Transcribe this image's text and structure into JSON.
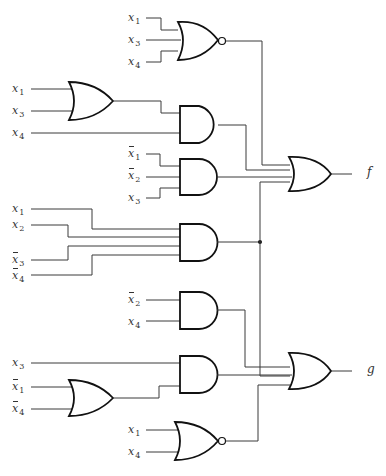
{
  "diagram": {
    "title": "",
    "outputs": {
      "f": "f",
      "g": "g"
    },
    "labels": [
      {
        "id": "g1_in1",
        "var": "x",
        "sub": "1",
        "complement": false,
        "x": 128,
        "y": 12
      },
      {
        "id": "g1_in2",
        "var": "x",
        "sub": "3",
        "complement": false,
        "x": 128,
        "y": 34
      },
      {
        "id": "g1_in3",
        "var": "x",
        "sub": "4",
        "complement": false,
        "x": 128,
        "y": 56
      },
      {
        "id": "g2_in1",
        "var": "x",
        "sub": "1",
        "complement": false,
        "x": 12,
        "y": 83
      },
      {
        "id": "g2_in2",
        "var": "x",
        "sub": "3",
        "complement": false,
        "x": 12,
        "y": 105
      },
      {
        "id": "g3_in2",
        "var": "x",
        "sub": "4",
        "complement": false,
        "x": 12,
        "y": 127
      },
      {
        "id": "g4_in1",
        "var": "x",
        "sub": "1",
        "complement": true,
        "x": 128,
        "y": 148
      },
      {
        "id": "g4_in2",
        "var": "x",
        "sub": "2",
        "complement": true,
        "x": 128,
        "y": 170
      },
      {
        "id": "g4_in3",
        "var": "x",
        "sub": "3",
        "complement": false,
        "x": 128,
        "y": 192
      },
      {
        "id": "g5_in1",
        "var": "x",
        "sub": "1",
        "complement": false,
        "x": 12,
        "y": 203
      },
      {
        "id": "g5_in2",
        "var": "x",
        "sub": "2",
        "complement": false,
        "x": 12,
        "y": 219
      },
      {
        "id": "g5_in3",
        "var": "x",
        "sub": "3",
        "complement": true,
        "x": 12,
        "y": 254
      },
      {
        "id": "g5_in4",
        "var": "x",
        "sub": "4",
        "complement": true,
        "x": 12,
        "y": 270
      },
      {
        "id": "g6_in1",
        "var": "x",
        "sub": "2",
        "complement": true,
        "x": 128,
        "y": 294
      },
      {
        "id": "g6_in2",
        "var": "x",
        "sub": "4",
        "complement": false,
        "x": 128,
        "y": 316
      },
      {
        "id": "g7_in1",
        "var": "x",
        "sub": "3",
        "complement": false,
        "x": 12,
        "y": 357
      },
      {
        "id": "g8_in1",
        "var": "x",
        "sub": "1",
        "complement": true,
        "x": 12,
        "y": 381
      },
      {
        "id": "g8_in2",
        "var": "x",
        "sub": "4",
        "complement": true,
        "x": 12,
        "y": 403
      },
      {
        "id": "g9_in1",
        "var": "x",
        "sub": "1",
        "complement": false,
        "x": 128,
        "y": 424
      },
      {
        "id": "g9_in2",
        "var": "x",
        "sub": "4",
        "complement": false,
        "x": 128,
        "y": 446
      }
    ],
    "gates": [
      {
        "id": "g1",
        "type": "NOR",
        "inputs": [
          "x1",
          "x3",
          "x4"
        ]
      },
      {
        "id": "g2",
        "type": "OR",
        "inputs": [
          "x1",
          "x3"
        ]
      },
      {
        "id": "g3",
        "type": "AND",
        "inputs": [
          "g2",
          "x4"
        ]
      },
      {
        "id": "g4",
        "type": "AND",
        "inputs": [
          "x1'",
          "x2'",
          "x3"
        ]
      },
      {
        "id": "g5",
        "type": "AND",
        "inputs": [
          "x1",
          "x2",
          "x3'",
          "x4'"
        ]
      },
      {
        "id": "g6",
        "type": "AND",
        "inputs": [
          "x2'",
          "x4"
        ]
      },
      {
        "id": "g8",
        "type": "OR",
        "inputs": [
          "x1'",
          "x4'"
        ]
      },
      {
        "id": "g7",
        "type": "AND",
        "inputs": [
          "x3",
          "g8"
        ]
      },
      {
        "id": "g9",
        "type": "NOR",
        "inputs": [
          "x1",
          "x4"
        ]
      },
      {
        "id": "gf",
        "type": "OR",
        "inputs": [
          "g1",
          "g3",
          "g4",
          "g5"
        ],
        "output": "f"
      },
      {
        "id": "gg",
        "type": "OR",
        "inputs": [
          "g5",
          "g6",
          "g7",
          "g9"
        ],
        "output": "g"
      }
    ]
  }
}
